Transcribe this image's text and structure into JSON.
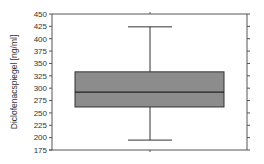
{
  "chart_data": {
    "type": "box",
    "title": "",
    "xlabel": "",
    "ylabel": "Diclofenacspiegel [ng/ml]",
    "ylim": [
      175,
      450
    ],
    "yticks": [
      175,
      200,
      225,
      250,
      275,
      300,
      325,
      350,
      375,
      400,
      425,
      450
    ],
    "grid": false,
    "legend": null,
    "series": [
      {
        "name": "Diclofenacspiegel",
        "whisker_low": 195,
        "q1": 262,
        "median": 292,
        "q3": 333,
        "whisker_high": 424
      }
    ]
  },
  "colors": {
    "box_fill": "#8c8c8c",
    "line": "#333333",
    "axis": "#555555"
  }
}
